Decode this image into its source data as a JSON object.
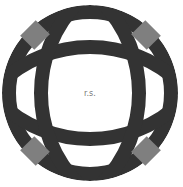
{
  "diagram": {
    "type": "quilt-block-pattern",
    "center_label": "r.s.",
    "colors": {
      "background": "#ffffff",
      "ring": "#333333",
      "corner_squares": "#7f7f7f",
      "label": "#777777"
    },
    "parts": {
      "outer_ring": 1,
      "inner_arcs": 4,
      "corner_squares": 4
    }
  }
}
